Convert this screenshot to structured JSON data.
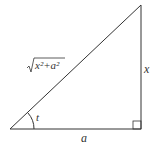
{
  "diagram": {
    "type": "right-triangle",
    "labels": {
      "hypotenuse": "x²+a²",
      "opposite": "x",
      "adjacent": "a",
      "angle": "t"
    },
    "stroke_color": "#333333"
  }
}
